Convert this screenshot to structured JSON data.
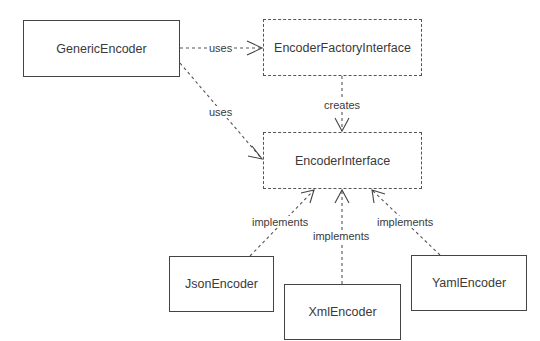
{
  "diagram": {
    "type": "UML class diagram",
    "nodes": {
      "generic_encoder": {
        "label": "GenericEncoder",
        "style": "solid"
      },
      "encoder_factory_interface": {
        "label": "EncoderFactoryInterface",
        "style": "dashed"
      },
      "encoder_interface": {
        "label": "EncoderInterface",
        "style": "dashed"
      },
      "json_encoder": {
        "label": "JsonEncoder",
        "style": "solid"
      },
      "xml_encoder": {
        "label": "XmlEncoder",
        "style": "solid"
      },
      "yaml_encoder": {
        "label": "YamlEncoder",
        "style": "solid"
      }
    },
    "edges": [
      {
        "from": "GenericEncoder",
        "to": "EncoderFactoryInterface",
        "label": "uses"
      },
      {
        "from": "GenericEncoder",
        "to": "EncoderInterface",
        "label": "uses"
      },
      {
        "from": "EncoderFactoryInterface",
        "to": "EncoderInterface",
        "label": "creates"
      },
      {
        "from": "JsonEncoder",
        "to": "EncoderInterface",
        "label": "implements"
      },
      {
        "from": "XmlEncoder",
        "to": "EncoderInterface",
        "label": "implements"
      },
      {
        "from": "YamlEncoder",
        "to": "EncoderInterface",
        "label": "implements"
      }
    ],
    "edge_labels": {
      "uses_factory": "uses",
      "uses_interface": "uses",
      "creates": "creates",
      "implements_json": "implements",
      "implements_xml": "implements",
      "implements_yaml": "implements"
    }
  }
}
